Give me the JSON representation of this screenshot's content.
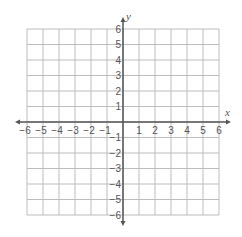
{
  "diagram": {
    "type": "coordinate-plane",
    "x_axis": {
      "label": "x",
      "min": -6,
      "max": 6,
      "step": 1,
      "tick_labels": [
        "−6",
        "−5",
        "−4",
        "−3",
        "−2",
        "−1",
        "1",
        "2",
        "3",
        "4",
        "5",
        "6"
      ]
    },
    "y_axis": {
      "label": "y",
      "min": -6,
      "max": 6,
      "step": 1,
      "tick_labels": [
        "6",
        "5",
        "4",
        "3",
        "2",
        "1",
        "−1",
        "−2",
        "−3",
        "−4",
        "−5",
        "−6"
      ]
    },
    "grid": {
      "left": 27,
      "top": 29,
      "cell_w": 16,
      "cell_h": 15.5,
      "cols": 12,
      "rows": 12
    },
    "colors": {
      "grid": "#bdbdbd",
      "axis": "#555555",
      "text": "#555555",
      "background": "#ffffff"
    }
  }
}
